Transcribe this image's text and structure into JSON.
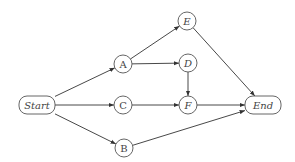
{
  "diagram": {
    "type": "directed-graph",
    "nodes": [
      {
        "id": "start",
        "label": "Start",
        "shape": "rounded-rect",
        "x": 37,
        "y": 105,
        "italic": true
      },
      {
        "id": "A",
        "label": "A",
        "shape": "circle",
        "x": 123,
        "y": 64,
        "italic": false
      },
      {
        "id": "C",
        "label": "C",
        "shape": "circle",
        "x": 123,
        "y": 105,
        "italic": false
      },
      {
        "id": "B",
        "label": "B",
        "shape": "circle",
        "x": 124,
        "y": 148,
        "italic": false
      },
      {
        "id": "E",
        "label": "E",
        "shape": "circle",
        "x": 187,
        "y": 21,
        "italic": true
      },
      {
        "id": "D",
        "label": "D",
        "shape": "circle",
        "x": 188,
        "y": 63,
        "italic": true
      },
      {
        "id": "F",
        "label": "F",
        "shape": "circle",
        "x": 188,
        "y": 105,
        "italic": true
      },
      {
        "id": "end",
        "label": "End",
        "shape": "rounded-rect",
        "x": 263,
        "y": 105,
        "italic": true
      }
    ],
    "edges": [
      {
        "from": "start",
        "to": "A"
      },
      {
        "from": "start",
        "to": "C"
      },
      {
        "from": "start",
        "to": "B"
      },
      {
        "from": "A",
        "to": "E"
      },
      {
        "from": "A",
        "to": "D"
      },
      {
        "from": "D",
        "to": "F"
      },
      {
        "from": "C",
        "to": "F"
      },
      {
        "from": "E",
        "to": "end"
      },
      {
        "from": "F",
        "to": "end"
      },
      {
        "from": "B",
        "to": "end"
      }
    ],
    "colors": {
      "stroke": "#555555",
      "edge": "#333333",
      "text": "#444444"
    }
  }
}
